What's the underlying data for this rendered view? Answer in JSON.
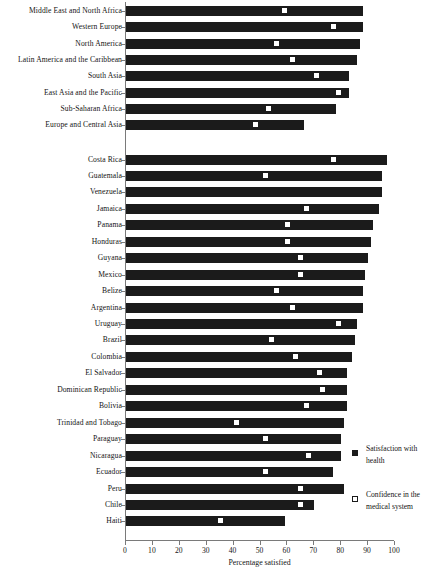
{
  "chart_data": {
    "type": "bar",
    "title": "",
    "xlabel": "Percentage satisfied",
    "ylabel": "",
    "xlim": [
      0,
      100
    ],
    "grid": false,
    "legend_position": "right-bottom",
    "xticks": [
      0,
      10,
      20,
      30,
      40,
      50,
      60,
      70,
      80,
      90,
      100
    ],
    "series": [
      {
        "name": "Satisfaction with health",
        "marker": "filled-square",
        "render": "bar"
      },
      {
        "name": "Confidence in the medical system",
        "marker": "open-square",
        "render": "point"
      }
    ],
    "groups": [
      {
        "name": "regions",
        "categories": [
          "Middle East and North Africa",
          "Western Europe",
          "North America",
          "Latin America and the Caribbean",
          "South Asia",
          "East Asia and the Pacific",
          "Sub-Saharan Africa",
          "Europe and Central Asia"
        ],
        "satisfaction_with_health": [
          88,
          88,
          87,
          86,
          83,
          83,
          78,
          66
        ],
        "confidence_in_medical_system": [
          59,
          77,
          56,
          62,
          71,
          79,
          53,
          48
        ]
      },
      {
        "name": "countries",
        "categories": [
          "Costa Rica",
          "Guatemala",
          "Venezuela",
          "Jamaica",
          "Panama",
          "Honduras",
          "Guyana",
          "Mexico",
          "Belize",
          "Argentina",
          "Uruguay",
          "Brazil",
          "Colombia",
          "El Salvador",
          "Dominican Republic",
          "Bolivia",
          "Trinidad and Tobago",
          "Paraguay",
          "Nicaragua",
          "Ecuador",
          "Peru",
          "Chile",
          "Haiti"
        ],
        "satisfaction_with_health": [
          97,
          95,
          95,
          94,
          92,
          91,
          90,
          89,
          88,
          88,
          86,
          85,
          84,
          82,
          82,
          82,
          81,
          80,
          80,
          77,
          81,
          70,
          59
        ],
        "confidence_in_medical_system": [
          77,
          52,
          null,
          67,
          60,
          60,
          65,
          65,
          56,
          62,
          79,
          54,
          63,
          72,
          73,
          67,
          41,
          52,
          68,
          52,
          65,
          65,
          35
        ]
      }
    ]
  },
  "legend": {
    "entries": [
      {
        "label": "Satisfaction with health",
        "swatch": "filled-square"
      },
      {
        "label": "Confidence in the medical system",
        "swatch": "open-square"
      }
    ]
  },
  "colors": {
    "bar": "#1b1b1b",
    "marker_fill": "#ffffff",
    "axis": "#7a7a7a",
    "text": "#141414",
    "background": "#ffffff"
  }
}
